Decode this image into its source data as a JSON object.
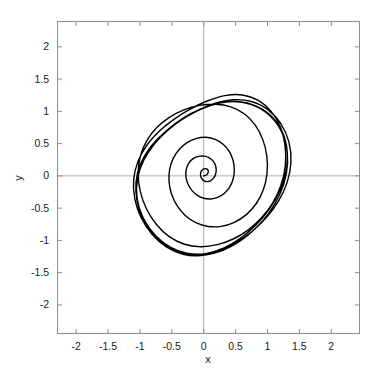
{
  "figure": {
    "background_color": "#ffffff",
    "plot_box": {
      "left_px": 57,
      "top_px": 21,
      "right_px": 360,
      "bottom_px": 334,
      "border_color": "#808080"
    },
    "zero_lines": {
      "color": "#aaaaaa",
      "x_zero_px": 207,
      "y_zero_px": 175
    }
  },
  "chart_data": {
    "type": "line",
    "title": "",
    "subtitle": "",
    "xlabel": "x",
    "ylabel": "y",
    "xlim": [
      -2.3,
      2.45
    ],
    "ylim": [
      -2.45,
      2.4
    ],
    "xticks": [
      -2,
      -1.5,
      -1,
      -0.5,
      0,
      0.5,
      1,
      1.5,
      2
    ],
    "xtick_labels": [
      "-2",
      "-1.5",
      "-1",
      "-0.5",
      "0",
      "0.5",
      "1",
      "1.5",
      "2"
    ],
    "yticks": [
      2,
      1.5,
      1,
      0.5,
      0,
      -0.5,
      -1,
      -1.5,
      -2
    ],
    "ytick_labels": [
      "2",
      "1.5",
      "1",
      "0.5",
      "0",
      "-0.5",
      "-1",
      "-1.5",
      "-2"
    ],
    "grid": false,
    "legend": null,
    "annotations": [],
    "series": [
      {
        "name": "trajectory",
        "color": "#000000",
        "line_width": 1.4,
        "description": "Outward spiral from near the origin converging onto a closed limit cycle",
        "x_extent": [
          -1.7,
          1.72
        ],
        "y_extent": [
          -1.16,
          1.17
        ],
        "points": [
          [
            0.0,
            0.0
          ],
          [
            0.035,
            0.01
          ],
          [
            0.062,
            0.034
          ],
          [
            0.072,
            0.068
          ],
          [
            0.06,
            0.098
          ],
          [
            0.03,
            0.112
          ],
          [
            -0.006,
            0.104
          ],
          [
            -0.036,
            0.076
          ],
          [
            -0.05,
            0.036
          ],
          [
            -0.046,
            -0.01
          ],
          [
            -0.024,
            -0.052
          ],
          [
            0.014,
            -0.08
          ],
          [
            0.062,
            -0.088
          ],
          [
            0.112,
            -0.072
          ],
          [
            0.156,
            -0.032
          ],
          [
            0.186,
            0.026
          ],
          [
            0.196,
            0.096
          ],
          [
            0.182,
            0.168
          ],
          [
            0.144,
            0.232
          ],
          [
            0.086,
            0.28
          ],
          [
            0.012,
            0.306
          ],
          [
            -0.068,
            0.306
          ],
          [
            -0.146,
            0.28
          ],
          [
            -0.212,
            0.226
          ],
          [
            -0.258,
            0.15
          ],
          [
            -0.28,
            0.058
          ],
          [
            -0.274,
            -0.042
          ],
          [
            -0.24,
            -0.142
          ],
          [
            -0.18,
            -0.232
          ],
          [
            -0.098,
            -0.302
          ],
          [
            0.0,
            -0.346
          ],
          [
            0.108,
            -0.358
          ],
          [
            0.218,
            -0.334
          ],
          [
            0.32,
            -0.274
          ],
          [
            0.404,
            -0.178
          ],
          [
            0.46,
            -0.052
          ],
          [
            0.48,
            0.092
          ],
          [
            0.46,
            0.24
          ],
          [
            0.4,
            0.378
          ],
          [
            0.304,
            0.49
          ],
          [
            0.18,
            0.566
          ],
          [
            0.038,
            0.598
          ],
          [
            -0.112,
            0.582
          ],
          [
            -0.256,
            0.52
          ],
          [
            -0.382,
            0.414
          ],
          [
            -0.478,
            0.272
          ],
          [
            -0.534,
            0.102
          ],
          [
            -0.544,
            -0.084
          ],
          [
            -0.506,
            -0.276
          ],
          [
            -0.42,
            -0.458
          ],
          [
            -0.29,
            -0.614
          ],
          [
            -0.124,
            -0.726
          ],
          [
            0.068,
            -0.784
          ],
          [
            0.276,
            -0.782
          ],
          [
            0.48,
            -0.72
          ],
          [
            0.668,
            -0.6
          ],
          [
            0.824,
            -0.428
          ],
          [
            0.936,
            -0.212
          ],
          [
            0.992,
            0.036
          ],
          [
            0.99,
            0.3
          ],
          [
            0.928,
            0.558
          ],
          [
            0.808,
            0.786
          ],
          [
            0.636,
            0.962
          ],
          [
            0.424,
            1.07
          ],
          [
            0.186,
            1.11
          ],
          [
            -0.064,
            1.092
          ],
          [
            -0.31,
            1.024
          ],
          [
            -0.538,
            0.908
          ],
          [
            -0.736,
            0.748
          ],
          [
            -0.892,
            0.546
          ],
          [
            -0.992,
            0.31
          ],
          [
            -1.028,
            0.046
          ],
          [
            -0.996,
            -0.232
          ],
          [
            -0.9,
            -0.506
          ],
          [
            -0.744,
            -0.75
          ],
          [
            -0.54,
            -0.942
          ],
          [
            -0.302,
            -1.06
          ],
          [
            -0.046,
            -1.098
          ],
          [
            0.212,
            -1.066
          ],
          [
            0.462,
            -0.978
          ],
          [
            0.694,
            -0.84
          ],
          [
            0.902,
            -0.654
          ],
          [
            1.078,
            -0.424
          ],
          [
            1.208,
            -0.152
          ],
          [
            1.278,
            0.15
          ],
          [
            1.276,
            0.462
          ],
          [
            1.204,
            0.752
          ],
          [
            1.06,
            0.996
          ],
          [
            0.856,
            1.17
          ],
          [
            0.606,
            1.254
          ],
          [
            0.33,
            1.244
          ],
          [
            0.054,
            1.16
          ],
          [
            -0.212,
            1.034
          ],
          [
            -0.462,
            0.88
          ],
          [
            -0.69,
            0.698
          ],
          [
            -0.886,
            0.482
          ],
          [
            -1.03,
            0.228
          ],
          [
            -1.098,
            -0.058
          ],
          [
            -1.08,
            -0.358
          ],
          [
            -0.98,
            -0.648
          ],
          [
            -0.81,
            -0.904
          ],
          [
            -0.586,
            -1.1
          ],
          [
            -0.324,
            -1.214
          ],
          [
            -0.046,
            -1.234
          ],
          [
            0.234,
            -1.168
          ],
          [
            0.504,
            -1.038
          ],
          [
            0.756,
            -0.862
          ],
          [
            0.982,
            -0.646
          ],
          [
            1.172,
            -0.392
          ],
          [
            1.308,
            -0.1
          ],
          [
            1.368,
            0.216
          ],
          [
            1.334,
            0.53
          ],
          [
            1.208,
            0.81
          ],
          [
            1.006,
            1.026
          ],
          [
            0.748,
            1.152
          ],
          [
            0.462,
            1.18
          ],
          [
            0.172,
            1.122
          ],
          [
            -0.11,
            1.004
          ],
          [
            -0.378,
            0.85
          ],
          [
            -0.624,
            0.666
          ],
          [
            -0.836,
            0.446
          ],
          [
            -0.99,
            0.186
          ],
          [
            -1.062,
            -0.104
          ],
          [
            -1.04,
            -0.406
          ],
          [
            -0.93,
            -0.69
          ],
          [
            -0.75,
            -0.932
          ],
          [
            -0.518,
            -1.108
          ],
          [
            -0.252,
            -1.202
          ],
          [
            0.03,
            -1.204
          ],
          [
            0.31,
            -1.12
          ],
          [
            0.574,
            -0.968
          ],
          [
            0.814,
            -0.766
          ],
          [
            1.022,
            -0.522
          ],
          [
            1.186,
            -0.242
          ],
          [
            1.288,
            0.066
          ],
          [
            1.308,
            0.386
          ],
          [
            1.23,
            0.686
          ],
          [
            1.058,
            0.928
          ],
          [
            0.816,
            1.086
          ],
          [
            0.538,
            1.152
          ],
          [
            0.25,
            1.13
          ],
          [
            -0.03,
            1.04
          ],
          [
            -0.296,
            0.902
          ],
          [
            -0.542,
            0.724
          ],
          [
            -0.764,
            0.506
          ],
          [
            -0.938,
            0.248
          ],
          [
            -1.038,
            -0.042
          ],
          [
            -1.044,
            -0.348
          ],
          [
            -0.956,
            -0.638
          ],
          [
            -0.79,
            -0.892
          ],
          [
            -0.562,
            -1.086
          ],
          [
            -0.292,
            -1.2
          ],
          [
            0.0,
            -1.224
          ],
          [
            0.292,
            -1.156
          ],
          [
            0.568,
            -1.012
          ],
          [
            0.818,
            -0.808
          ],
          [
            1.032,
            -0.56
          ],
          [
            1.198,
            -0.274
          ],
          [
            1.296,
            0.04
          ],
          [
            1.31,
            0.366
          ],
          [
            1.228,
            0.67
          ],
          [
            1.054,
            0.918
          ],
          [
            0.808,
            1.082
          ],
          [
            0.524,
            1.148
          ],
          [
            0.23,
            1.126
          ],
          [
            -0.054,
            1.034
          ],
          [
            -0.322,
            0.896
          ],
          [
            -0.568,
            0.714
          ],
          [
            -0.786,
            0.494
          ],
          [
            -0.956,
            0.234
          ],
          [
            -1.05,
            -0.056
          ],
          [
            -1.05,
            -0.36
          ],
          [
            -0.958,
            -0.648
          ],
          [
            -0.79,
            -0.9
          ],
          [
            -0.56,
            -1.092
          ],
          [
            -0.288,
            -1.204
          ],
          [
            0.004,
            -1.226
          ]
        ]
      }
    ]
  }
}
